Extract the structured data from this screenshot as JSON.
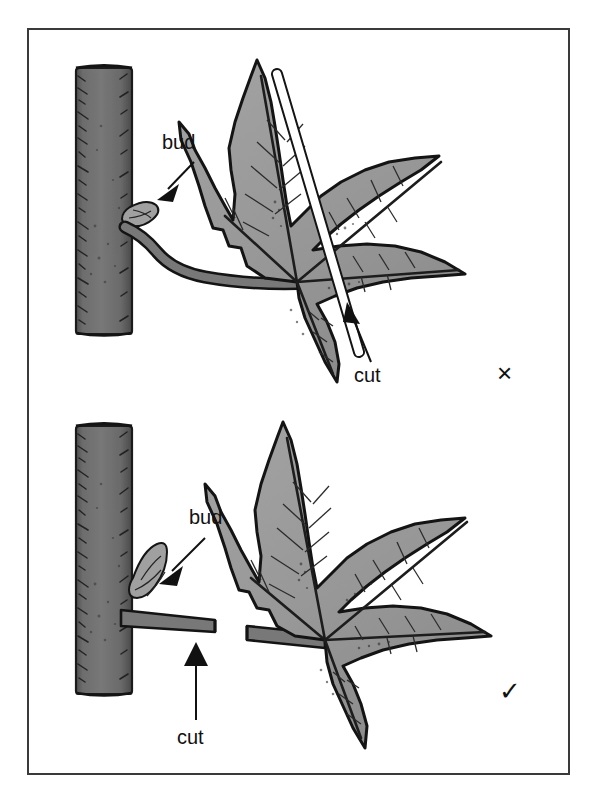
{
  "figure": {
    "background_color": "#ffffff",
    "frame_color": "#3a3a3a",
    "branch_color": "#6e6e6e",
    "leaf_color": "#9a9a9a",
    "outline_color": "#111111",
    "cut_line_color": "#ffffff"
  },
  "panels": [
    {
      "id": "incorrect",
      "verdict_symbol": "×",
      "verdict_name": "cross-mark",
      "bud_label": "bud",
      "cut_label": "cut",
      "description": "Cut made through the leaf blade, too far from the branch, leaving the whole petiole attached"
    },
    {
      "id": "correct",
      "verdict_symbol": "✓",
      "verdict_name": "check-mark",
      "bud_label": "bud",
      "cut_label": "cut",
      "description": "Cut made across the petiole just beyond the bud, leaving a short clean stub"
    }
  ]
}
